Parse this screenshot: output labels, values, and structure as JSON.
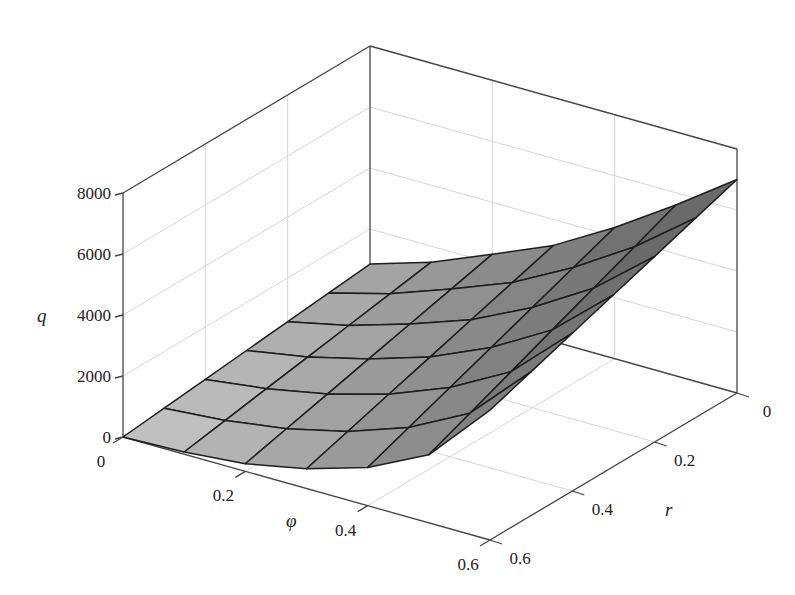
{
  "chart_data": {
    "type": "surface3d",
    "title": "",
    "xlabel": "φ",
    "ylabel": "r",
    "zlabel": "q",
    "x": [
      0,
      0.1,
      0.2,
      0.3,
      0.4,
      0.5,
      0.6
    ],
    "y": [
      0,
      0.1,
      0.2,
      0.3,
      0.4,
      0.5,
      0.6
    ],
    "z_edges": {
      "r_0": [
        850,
        1475,
        2300,
        3150,
        4300,
        5600,
        7000
      ],
      "r_0.6": [
        0,
        70,
        250,
        650,
        1250,
        2230,
        4260
      ]
    },
    "z_description": "q estimated on 7x7 grid; q(φ,r) interpolated linearly in r between the r=0 and r=0.6 edge curves",
    "xlim": [
      0,
      0.6
    ],
    "ylim": [
      0,
      0.6
    ],
    "zlim": [
      0,
      8000
    ],
    "x_ticks": [
      "0",
      "0.2",
      "0.4",
      "0.6"
    ],
    "y_ticks": [
      "0",
      "0.2",
      "0.4",
      "0.6"
    ],
    "z_ticks": [
      "0",
      "2000",
      "4000",
      "6000",
      "8000"
    ],
    "grid": true,
    "colormap": "gray shaded",
    "legend": null
  },
  "axes": {
    "x_label": "φ",
    "y_label": "r",
    "z_label": "q",
    "x_ticks": [
      {
        "v": 0,
        "label": "0"
      },
      {
        "v": 0.2,
        "label": "0.2"
      },
      {
        "v": 0.4,
        "label": "0.4"
      },
      {
        "v": 0.6,
        "label": "0.6"
      }
    ],
    "y_ticks": [
      {
        "v": 0,
        "label": "0"
      },
      {
        "v": 0.2,
        "label": "0.2"
      },
      {
        "v": 0.4,
        "label": "0.4"
      },
      {
        "v": 0.6,
        "label": "0.6"
      }
    ],
    "z_ticks": [
      {
        "v": 0,
        "label": "0"
      },
      {
        "v": 2000,
        "label": "2000"
      },
      {
        "v": 4000,
        "label": "4000"
      },
      {
        "v": 6000,
        "label": "6000"
      },
      {
        "v": 8000,
        "label": "8000"
      }
    ]
  },
  "colors": {
    "background": "#ffffff",
    "axis": "#444444",
    "grid": "#d6d6d6",
    "mesh_edge": "#1e1e1e",
    "surface_light": "#c9c9c9",
    "surface_dark": "#6a6a6a"
  }
}
